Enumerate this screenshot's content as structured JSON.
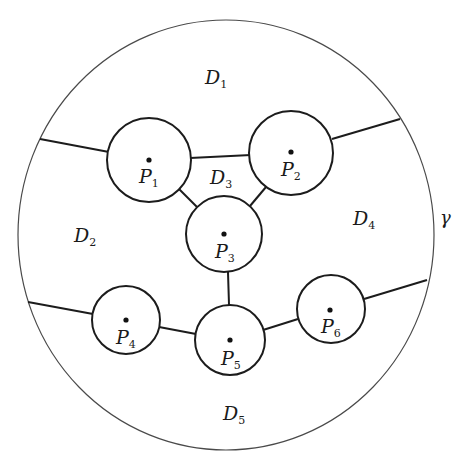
{
  "diagram": {
    "boundary": {
      "label": "γ",
      "cx": 226,
      "cy": 235,
      "rx": 208,
      "ry": 215
    },
    "points": [
      {
        "id": "P1",
        "letter": "P",
        "index": "1",
        "cx": 149,
        "cy": 160,
        "r": 42
      },
      {
        "id": "P2",
        "letter": "P",
        "index": "2",
        "cx": 291,
        "cy": 153,
        "r": 42
      },
      {
        "id": "P3",
        "letter": "P",
        "index": "3",
        "cx": 224,
        "cy": 234,
        "r": 38
      },
      {
        "id": "P4",
        "letter": "P",
        "index": "4",
        "cx": 126,
        "cy": 320,
        "r": 34
      },
      {
        "id": "P5",
        "letter": "P",
        "index": "5",
        "cx": 230,
        "cy": 340,
        "r": 35
      },
      {
        "id": "P6",
        "letter": "P",
        "index": "6",
        "cx": 331,
        "cy": 309,
        "r": 34
      }
    ],
    "regions": [
      {
        "id": "D1",
        "letter": "D",
        "index": "1"
      },
      {
        "id": "D2",
        "letter": "D",
        "index": "2"
      },
      {
        "id": "D3",
        "letter": "D",
        "index": "3"
      },
      {
        "id": "D4",
        "letter": "D",
        "index": "4"
      },
      {
        "id": "D5",
        "letter": "D",
        "index": "5"
      }
    ],
    "edges": [
      {
        "from": "γ",
        "to": "P1"
      },
      {
        "from": "P1",
        "to": "P2"
      },
      {
        "from": "P2",
        "to": "γ"
      },
      {
        "from": "P1",
        "to": "P3"
      },
      {
        "from": "P2",
        "to": "P3"
      },
      {
        "from": "P3",
        "to": "P5"
      },
      {
        "from": "γ",
        "to": "P4"
      },
      {
        "from": "P4",
        "to": "P5"
      },
      {
        "from": "P5",
        "to": "P6"
      },
      {
        "from": "P6",
        "to": "γ"
      }
    ]
  }
}
